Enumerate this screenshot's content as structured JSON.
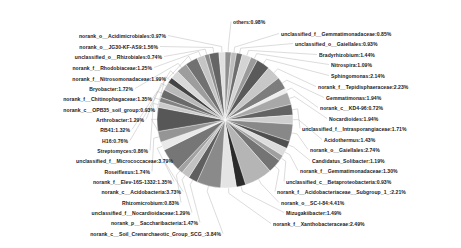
{
  "chart_data": {
    "type": "pie",
    "title": "",
    "subtitle": "",
    "xlabel": "",
    "ylabel": "",
    "legend_position": "none",
    "grid": false,
    "label_format": "name:percent",
    "units": "percent",
    "center": {
      "x": 225,
      "y": 120
    },
    "radius": 68,
    "start_angle_deg": 90,
    "direction": "clockwise",
    "categories": [
      "others",
      "unclassified_f__Gemmatimonadaceae",
      "unclassified_o__Gaiellales",
      "Bradyrhizobium",
      "Nitrospira",
      "Sphingomonas",
      "norank_f__Tepidisphaeraceae",
      "Gemmatimonas",
      "norank_c__KD4-96",
      "Nocardioides",
      "unclassified_f__Intrasporangiaceae",
      "Acidothermus",
      "norank_o__Gaiellales",
      "Candidatus_Solibacter",
      "norank_f__Gemmatimonadaceae",
      "unclassified_c__Betaproteobacteria",
      "norank_f__Acidobacteriaceae__Subgroup_1_",
      "norank_o__SC-I-84",
      "Mizugakiibacter",
      "norank_f__Xanthobacteraceae",
      "norank_c__Soil_Crenarchaeotic_Group_SCG_",
      "norank_p__Saccharibacteria",
      "unclassified_f__Nocardioidaceae",
      "Rhizomicrobium",
      "norank_c__Acidobacteria",
      "norank_f__Elev-16S-1332",
      "Roseiflexus",
      "unclassified_f__Micrococcaceae",
      "Streptomyces",
      "H16",
      "RB41",
      "Arthrobacter",
      "norank_c__OPB35_soil_group",
      "norank_f__Chitinophagaceae",
      "Bryobacter",
      "norank_f__Nitrosomonadaceae",
      "norank_f__Rhodobiaceae",
      "unclassified_o__Rhizobiales",
      "norank_o__JG30-KF-AS9",
      "norank_o__Acidimicrobiales"
    ],
    "values": [
      0.98,
      0.85,
      0.93,
      1.44,
      1.09,
      2.14,
      2.23,
      1.94,
      0.72,
      1.94,
      1.71,
      1.43,
      2.74,
      1.19,
      1.3,
      0.93,
      2.21,
      4.41,
      1.49,
      2.49,
      3.84,
      1.47,
      1.29,
      0.83,
      3.73,
      1.35,
      1.74,
      3.79,
      0.86,
      0.76,
      1.32,
      1.29,
      0.93,
      1.35,
      1.72,
      1.99,
      1.25,
      0.74,
      1.56,
      0.97
    ],
    "labels": [
      "others:0.98%",
      "unclassified_f__Gemmatimonadaceae:0.85%",
      "unclassified_o__Gaiellales:0.93%",
      "Bradyrhizobium:1.44%",
      "Nitrospira:1.09%",
      "Sphingomonas:2.14%",
      "norank_f__Tepidisphaeraceae:2.23%",
      "Gemmatimonas:1.94%",
      "norank_c__KD4-96:0.72%",
      "Nocardioides:1.94%",
      "unclassified_f__Intrasporangiaceae:1.71%",
      "Acidothermus:1.43%",
      "norank_o__Gaiellales:2.74%",
      "Candidatus_Solibacter:1.19%",
      "norank_f__Gemmatimonadaceae:1.30%",
      "unclassified_c__Betaproteobacteria:0.93%",
      "norank_f__Acidobacteriaceae__Subgroup_1_:2.21%",
      "norank_o__SC-I-84:4.41%",
      "Mizugakiibacter:1.49%",
      "norank_f__Xanthobacteraceae:2.49%",
      "norank_c__Soil_Crenarchaeotic_Group_SCG_:3.84%",
      "norank_p__Saccharibacteria:1.47%",
      "unclassified_f__Nocardioidaceae:1.29%",
      "Rhizomicrobium:0.83%",
      "norank_c__Acidobacteria:3.73%",
      "norank_f__Elev-16S-1332:1.35%",
      "Roseiflexus:1.74%",
      "unclassified_f__Micrococcaceae:3.79%",
      "Streptomyces:0.86%",
      "H16:0.76%",
      "RB41:1.32%",
      "Arthrobacter:1.29%",
      "norank_c__OPB35_soil_group:0.93%",
      "norank_f__Chitinophagaceae:1.35%",
      "Bryobacter:1.72%",
      "norank_f__Nitrosomonadaceae:1.99%",
      "norank_f__Rhodobiaceae:1.25%",
      "unclassified_o__Rhizobiales:0.74%",
      "norank_o__JG30-KF-AS9:1.56%",
      "norank_o__Acidimicrobiales:0.97%"
    ],
    "colors": [
      "#8f8f8f",
      "#bdbdbd",
      "#6e6e6e",
      "#d4d4d4",
      "#9a9a9a",
      "#5a5a5a",
      "#c8c8c8",
      "#7d7d7d",
      "#ededed",
      "#a8a8a8",
      "#636363",
      "#cfcfcf",
      "#888888",
      "#4f4f4f",
      "#dcdcdc",
      "#9f9f9f",
      "#747474",
      "#b5b5b5",
      "#2b2b2b",
      "#e4e4e4",
      "#8a8a8a",
      "#5f5f5f",
      "#c2c2c2",
      "#a2a2a2",
      "#767676",
      "#e9e9e9",
      "#959595",
      "#575757",
      "#cbcbcb",
      "#838383",
      "#6a6a6a",
      "#b9b9b9",
      "#444444",
      "#d8d8d8",
      "#9d9d9d",
      "#717171",
      "#c5c5c5",
      "#8c8c8c",
      "#656565",
      "#e0e0e0"
    ],
    "label_positions": [
      {
        "side": "right",
        "x": 233,
        "y": 19,
        "anchor_deg": 92
      },
      {
        "side": "right",
        "x": 281,
        "y": 31,
        "anchor_deg": 84
      },
      {
        "side": "right",
        "x": 295,
        "y": 41,
        "anchor_deg": 80
      },
      {
        "side": "right",
        "x": 319,
        "y": 52,
        "anchor_deg": 75
      },
      {
        "side": "right",
        "x": 331,
        "y": 62,
        "anchor_deg": 70
      },
      {
        "side": "right",
        "x": 331,
        "y": 73,
        "anchor_deg": 63
      },
      {
        "side": "right",
        "x": 318,
        "y": 84,
        "anchor_deg": 55
      },
      {
        "side": "right",
        "x": 326,
        "y": 95,
        "anchor_deg": 46
      },
      {
        "side": "right",
        "x": 320,
        "y": 105,
        "anchor_deg": 41
      },
      {
        "side": "right",
        "x": 329,
        "y": 116,
        "anchor_deg": 37
      },
      {
        "side": "right",
        "x": 302,
        "y": 126,
        "anchor_deg": 31
      },
      {
        "side": "right",
        "x": 324,
        "y": 137,
        "anchor_deg": 25
      },
      {
        "side": "right",
        "x": 310,
        "y": 147,
        "anchor_deg": 18
      },
      {
        "side": "right",
        "x": 312,
        "y": 158,
        "anchor_deg": 10
      },
      {
        "side": "right",
        "x": 300,
        "y": 168,
        "anchor_deg": 3
      },
      {
        "side": "right",
        "x": 286,
        "y": 179,
        "anchor_deg": -4
      },
      {
        "side": "right",
        "x": 277,
        "y": 189,
        "anchor_deg": -12
      },
      {
        "side": "right",
        "x": 281,
        "y": 200,
        "anchor_deg": -20
      },
      {
        "side": "right",
        "x": 286,
        "y": 210,
        "anchor_deg": -27
      },
      {
        "side": "right",
        "x": 273,
        "y": 221,
        "anchor_deg": -34
      },
      {
        "side": "left",
        "x": 221,
        "y": 231,
        "anchor_deg": -42
      },
      {
        "side": "left",
        "x": 198,
        "y": 220,
        "anchor_deg": -50
      },
      {
        "side": "left",
        "x": 190,
        "y": 210,
        "anchor_deg": -57
      },
      {
        "side": "left",
        "x": 179,
        "y": 200,
        "anchor_deg": -63
      },
      {
        "side": "left",
        "x": 181,
        "y": 189,
        "anchor_deg": -70
      },
      {
        "side": "left",
        "x": 172,
        "y": 179,
        "anchor_deg": -76
      },
      {
        "side": "left",
        "x": 150,
        "y": 169,
        "anchor_deg": -82
      },
      {
        "side": "left",
        "x": 173,
        "y": 158,
        "anchor_deg": -89
      },
      {
        "side": "left",
        "x": 148,
        "y": 148,
        "anchor_deg": -96
      },
      {
        "side": "left",
        "x": 128,
        "y": 138,
        "anchor_deg": -102
      },
      {
        "side": "left",
        "x": 130,
        "y": 127,
        "anchor_deg": -108
      },
      {
        "side": "left",
        "x": 144,
        "y": 117,
        "anchor_deg": -114
      },
      {
        "side": "left",
        "x": 155,
        "y": 107,
        "anchor_deg": -120
      },
      {
        "side": "left",
        "x": 152,
        "y": 96,
        "anchor_deg": -126
      },
      {
        "side": "left",
        "x": 133,
        "y": 86,
        "anchor_deg": -133
      },
      {
        "side": "left",
        "x": 166,
        "y": 76,
        "anchor_deg": -139
      },
      {
        "side": "left",
        "x": 152,
        "y": 65,
        "anchor_deg": -146
      },
      {
        "side": "left",
        "x": 162,
        "y": 54,
        "anchor_deg": -153
      },
      {
        "side": "left",
        "x": 158,
        "y": 44,
        "anchor_deg": -160
      },
      {
        "side": "left",
        "x": 166,
        "y": 33,
        "anchor_deg": -167
      }
    ]
  }
}
